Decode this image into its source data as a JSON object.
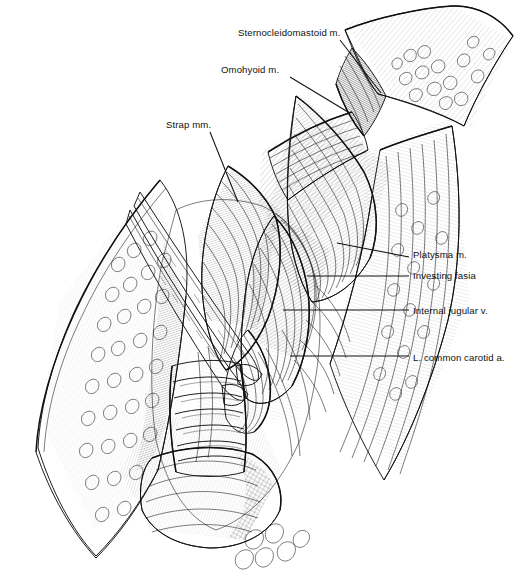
{
  "figure": {
    "background_color": "#ffffff",
    "ink_color": "#111111",
    "style": "pen-and-ink medical illustration, line hatching",
    "width": 527,
    "height": 586
  },
  "labels": [
    {
      "id": "sternocleidomastoid",
      "text": "Sternocleidomastoid m.",
      "x": 238,
      "y": 28,
      "anchor": "start",
      "leader": {
        "x1": 340,
        "y1": 40,
        "x2": 381,
        "y2": 93
      }
    },
    {
      "id": "omohyoid",
      "text": "Omohyoid m.",
      "x": 221,
      "y": 65,
      "anchor": "start",
      "leader": {
        "x1": 290,
        "y1": 77,
        "x2": 348,
        "y2": 112
      }
    },
    {
      "id": "strap",
      "text": "Strap mm.",
      "x": 166,
      "y": 120,
      "anchor": "start",
      "leader": {
        "x1": 210,
        "y1": 132,
        "x2": 238,
        "y2": 202
      }
    },
    {
      "id": "platysma",
      "text": "Platysma m.",
      "x": 413,
      "y": 250,
      "anchor": "start",
      "leader": {
        "x1": 337,
        "y1": 243,
        "x2": 409,
        "y2": 257
      }
    },
    {
      "id": "investing-fascia",
      "text": "Investing fasia",
      "x": 413,
      "y": 271,
      "anchor": "start",
      "leader": {
        "x1": 307,
        "y1": 276,
        "x2": 409,
        "y2": 276
      }
    },
    {
      "id": "internal-jugular-vein",
      "text": "Internal jugular v.",
      "x": 413,
      "y": 306,
      "anchor": "start",
      "leader": {
        "x1": 283,
        "y1": 310,
        "x2": 409,
        "y2": 310
      }
    },
    {
      "id": "left-common-carotid-artery",
      "text": "L. common carotid a.",
      "x": 413,
      "y": 353,
      "anchor": "start",
      "leader": {
        "x1": 290,
        "y1": 356,
        "x2": 409,
        "y2": 356
      }
    }
  ],
  "structures": [
    {
      "id": "skin-flap-upper-right",
      "name": "reflected skin flap, superolateral"
    },
    {
      "id": "skin-edge-left",
      "name": "skin and subcutaneous fat edge, medial"
    },
    {
      "id": "platysma-layer",
      "name": "platysma muscle layer"
    },
    {
      "id": "investing-fascia-layer",
      "name": "investing layer of deep cervical fascia"
    },
    {
      "id": "sternocleidomastoid-muscle",
      "name": "sternocleidomastoid muscle"
    },
    {
      "id": "omohyoid-muscle",
      "name": "omohyoid muscle, superior belly"
    },
    {
      "id": "strap-muscles",
      "name": "strap muscles (sternohyoid, sternothyroid)"
    },
    {
      "id": "internal-jugular-vein-vessel",
      "name": "internal jugular vein"
    },
    {
      "id": "common-carotid-artery-vessel",
      "name": "left common carotid artery"
    },
    {
      "id": "trachea",
      "name": "trachea with cartilaginous rings"
    },
    {
      "id": "thyroid-gland",
      "name": "thyroid gland lobe"
    },
    {
      "id": "retractor-blades",
      "name": "crossed retractor instruments"
    }
  ]
}
